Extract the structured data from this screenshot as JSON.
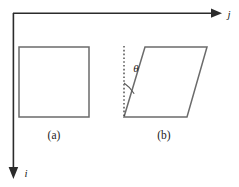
{
  "figure": {
    "background_color": "#ffffff",
    "axes": {
      "horizontal": {
        "name": "j-axis",
        "label": "j",
        "label_style": "italic",
        "direction": "right",
        "color": "#2b2b2b",
        "origin": [
          13,
          13
        ],
        "end": [
          222,
          13
        ]
      },
      "vertical": {
        "name": "i-axis",
        "label": "i",
        "label_style": "italic",
        "direction": "down",
        "color": "#2b2b2b",
        "origin": [
          13,
          13
        ],
        "end": [
          13,
          178
        ]
      }
    },
    "shapes": [
      {
        "name": "square",
        "caption": "(a)",
        "stroke_color": "#6b6b6b",
        "fill_color": "#ffffff",
        "points": "19,47 89,47 89,117 19,117"
      },
      {
        "name": "parallelogram",
        "caption": "(b)",
        "stroke_color": "#6b6b6b",
        "fill_color": "#ffffff",
        "points": "124,117 145,47 207,47 187,117"
      }
    ],
    "annotations": {
      "dotted_guide": {
        "name": "vertical-dotted-guide",
        "color": "#3a3a3a",
        "from": [
          124,
          47
        ],
        "to": [
          124,
          117
        ]
      },
      "angle": {
        "name": "theta-angle",
        "symbol": "θ",
        "vertex": [
          124,
          117
        ],
        "arc_radius": 34
      }
    },
    "captions": [
      {
        "name": "caption-a",
        "text": "(a)",
        "x": 54,
        "y": 138
      },
      {
        "name": "caption-b",
        "text": "(b)",
        "x": 164,
        "y": 138
      }
    ]
  }
}
